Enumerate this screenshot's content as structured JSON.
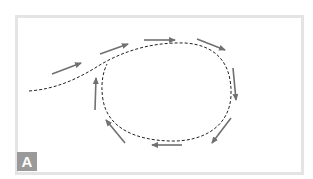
{
  "figure": {
    "panel_label": "A",
    "colors": {
      "frame": "#e4e4e4",
      "path": "#222222",
      "arrow": "#707070",
      "label_bg": "#9a9a9a",
      "label_text": "#ffffff"
    },
    "path": {
      "style": "dashed",
      "description": "Incoming trajectory curving into a closed clockwise loop"
    },
    "arrows": [
      {
        "from": [
          52,
          74
        ],
        "to": [
          81,
          63
        ]
      },
      {
        "from": [
          100,
          54
        ],
        "to": [
          128,
          44
        ]
      },
      {
        "from": [
          144,
          40
        ],
        "to": [
          175,
          40
        ]
      },
      {
        "from": [
          197,
          39
        ],
        "to": [
          225,
          50
        ]
      },
      {
        "from": [
          233,
          68
        ],
        "to": [
          236,
          100
        ]
      },
      {
        "from": [
          231,
          118
        ],
        "to": [
          212,
          143
        ]
      },
      {
        "from": [
          182,
          145
        ],
        "to": [
          152,
          145
        ]
      },
      {
        "from": [
          125,
          143
        ],
        "to": [
          106,
          120
        ]
      },
      {
        "from": [
          95,
          110
        ],
        "to": [
          96,
          78
        ]
      }
    ],
    "flow_direction": "clockwise"
  }
}
